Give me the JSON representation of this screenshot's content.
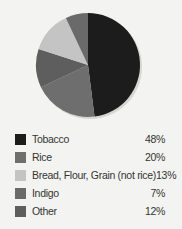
{
  "chart_data": {
    "type": "pie",
    "title": "",
    "slices": [
      {
        "label": "Tobacco",
        "value": 48,
        "pct_label": "48%",
        "color": "#1c1c1c"
      },
      {
        "label": "Rice",
        "value": 20,
        "pct_label": "20%",
        "color": "#6e6e6e"
      },
      {
        "label": "Bread, Flour, Grain (not rice)",
        "value": 13,
        "pct_label": "13%",
        "color": "#c4c4c4"
      },
      {
        "label": "Indigo",
        "value": 7,
        "pct_label": "7%",
        "color": "#6a6a6a"
      },
      {
        "label": "Other",
        "value": 12,
        "pct_label": "12%",
        "color": "#5e5e5e"
      }
    ],
    "pie_order_clockwise_from_top": [
      "Tobacco",
      "Rice",
      "Other",
      "Bread, Flour, Grain (not rice)",
      "Indigo"
    ],
    "legend_position": "bottom"
  }
}
